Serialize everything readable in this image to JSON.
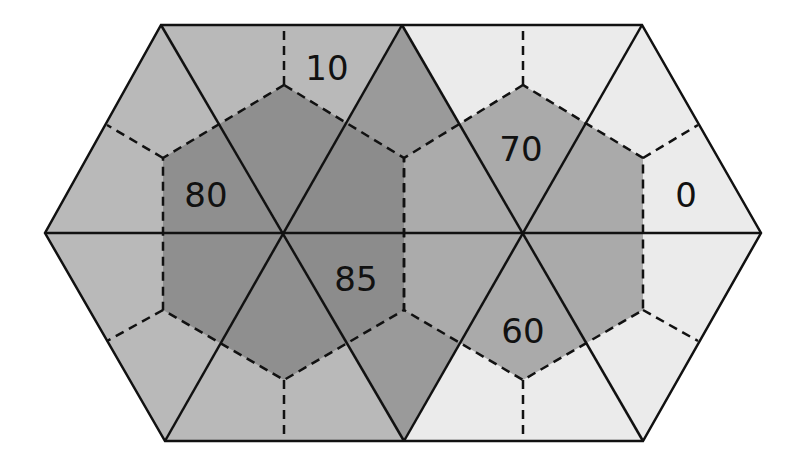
{
  "diagram": {
    "type": "hexagonal-triangular-tessellation",
    "labels": [
      {
        "id": "label-top-left",
        "text": "10",
        "x": 327,
        "y": 68
      },
      {
        "id": "label-left-hex",
        "text": "80",
        "x": 206,
        "y": 195
      },
      {
        "id": "label-right-hex-top",
        "text": "70",
        "x": 521,
        "y": 149
      },
      {
        "id": "label-right",
        "text": "0",
        "x": 686,
        "y": 195
      },
      {
        "id": "label-center",
        "text": "85",
        "x": 356,
        "y": 279
      },
      {
        "id": "label-right-hex-bottom",
        "text": "60",
        "x": 523,
        "y": 331
      }
    ],
    "colors": {
      "left_outer": "#b9b9b9",
      "left_inner": "#8f8f8f",
      "center_outer": "#9a9a9a",
      "center_left_inner": "#8c8c8c",
      "center_right_inner": "#ababab",
      "right_outer": "#ebebeb",
      "right_inner": "#aaaaaa",
      "line": "#111111"
    }
  }
}
